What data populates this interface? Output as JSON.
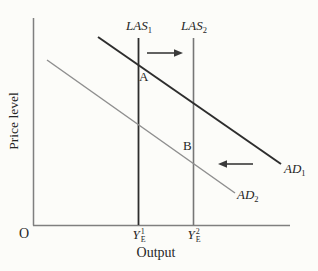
{
  "colors": {
    "dark_line": "#2d2d2d",
    "gray_line": "#8f8f8f",
    "las2_line": "#767676",
    "axis": "#7f7f7f",
    "arrow": "#3a3a3a",
    "text": "#262626",
    "background": "#fcfcf9"
  },
  "y_axis": {
    "label": "Price level"
  },
  "x_axis": {
    "label": "Output",
    "origin": "O",
    "tick1": {
      "base": "Y",
      "sup": "1",
      "sub": "E"
    },
    "tick2": {
      "base": "Y",
      "sup": "2",
      "sub": "E"
    }
  },
  "curves": {
    "las1": {
      "base": "LAS",
      "sub": "1"
    },
    "las2": {
      "base": "LAS",
      "sub": "2"
    },
    "ad1": {
      "base": "AD",
      "sub": "1"
    },
    "ad2": {
      "base": "AD",
      "sub": "2"
    }
  },
  "points": {
    "a": "A",
    "b": "B"
  },
  "icons": {
    "right_arrow": "rightward-shift-arrow",
    "left_arrow": "leftward-shift-arrow"
  }
}
